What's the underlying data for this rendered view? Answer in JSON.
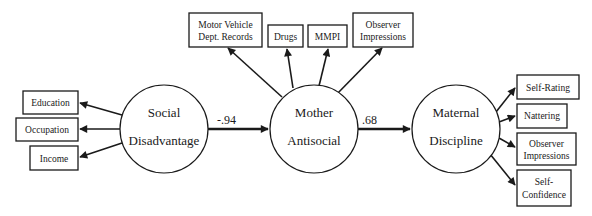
{
  "diagram": {
    "type": "structural-equation-model",
    "latent_nodes": [
      {
        "id": "social",
        "line1": "Social",
        "line2": "Disadvantage"
      },
      {
        "id": "mother",
        "line1": "Mother",
        "line2": "Antisocial"
      },
      {
        "id": "discipline",
        "line1": "Maternal",
        "line2": "Discipline"
      }
    ],
    "paths": [
      {
        "from": "social",
        "to": "mother",
        "coefficient": "-.94"
      },
      {
        "from": "mother",
        "to": "discipline",
        "coefficient": ".68"
      }
    ],
    "indicators": {
      "social": [
        {
          "line1": "Education",
          "line2": ""
        },
        {
          "line1": "Occupation",
          "line2": ""
        },
        {
          "line1": "Income",
          "line2": ""
        }
      ],
      "mother": [
        {
          "line1": "Motor Vehicle",
          "line2": "Dept. Records"
        },
        {
          "line1": "Drugs",
          "line2": ""
        },
        {
          "line1": "MMPI",
          "line2": ""
        },
        {
          "line1": "Observer",
          "line2": "Impressions"
        }
      ],
      "discipline": [
        {
          "line1": "Self-Rating",
          "line2": ""
        },
        {
          "line1": "Nattering",
          "line2": ""
        },
        {
          "line1": "Observer",
          "line2": "Impressions"
        },
        {
          "line1": "Self-",
          "line2": "Confidence"
        }
      ]
    }
  }
}
